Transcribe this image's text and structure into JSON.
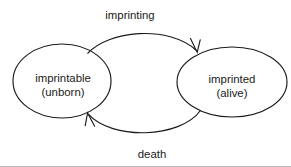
{
  "diagram": {
    "type": "state-transition-diagram",
    "background_color": "#ffffff",
    "stroke_color": "#1a1a1a",
    "states": [
      {
        "id": "imprintable",
        "label_line1": "imprintable",
        "label_line2": "(unborn)",
        "shape": "ellipse",
        "cx": 62,
        "cy": 81,
        "rx": 49,
        "ry": 37
      },
      {
        "id": "imprinted",
        "label_line1": "imprinted",
        "label_line2": "(alive)",
        "shape": "ellipse",
        "cx": 232,
        "cy": 82,
        "rx": 55,
        "ry": 35
      }
    ],
    "transitions": [
      {
        "id": "imprinting",
        "label": "imprinting",
        "from": "imprintable",
        "to": "imprinted",
        "direction": "left-to-right",
        "label_x": 130,
        "label_y": 19
      },
      {
        "id": "death",
        "label": "death",
        "from": "imprinted",
        "to": "imprintable",
        "direction": "right-to-left",
        "label_x": 152,
        "label_y": 158
      }
    ]
  }
}
